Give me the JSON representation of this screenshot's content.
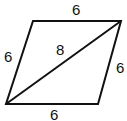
{
  "diagram": {
    "shape": "rhombus",
    "vertices": {
      "top_left": [
        33,
        21
      ],
      "top_right": [
        121,
        21
      ],
      "bottom_right": [
        98,
        104
      ],
      "bottom_left": [
        6,
        104
      ]
    },
    "labels": {
      "top": "6",
      "left": "6",
      "right": "6",
      "bottom": "6",
      "diagonal": "8"
    },
    "stroke_color": "#111111",
    "background": "#ffffff"
  }
}
